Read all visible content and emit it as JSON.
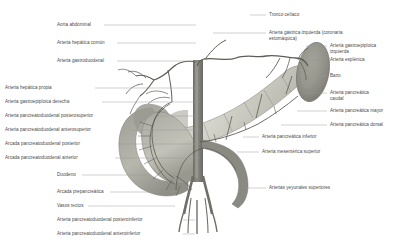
{
  "figure": {
    "language": "es",
    "background_color": "#ffffff",
    "text_color": "#4a4a4a",
    "leader_color": "#9a9a9a"
  },
  "labels_left": [
    {
      "id": "aorta-abdominal",
      "text": "Aorta abdominal",
      "x": 57,
      "y": 22,
      "line_x1": 104,
      "line_y1": 25,
      "line_x2": 196,
      "line_y2": 25
    },
    {
      "id": "arteria-hepatica-comun",
      "text": "Arteria hepática común",
      "x": 57,
      "y": 40,
      "line_x1": 117,
      "line_y1": 43,
      "line_x2": 196,
      "line_y2": 43
    },
    {
      "id": "arteria-gastroduodenal",
      "text": "Arteria gastroduodenal",
      "x": 57,
      "y": 58,
      "line_x1": 117,
      "line_y1": 61,
      "line_x2": 196,
      "line_y2": 61
    },
    {
      "id": "arteria-hepatica-propia",
      "text": "Arteria hepática propia",
      "x": 5,
      "y": 85,
      "line_x1": 95,
      "line_y1": 88,
      "line_x2": 200,
      "line_y2": 88
    },
    {
      "id": "arteria-gastroepiploica-derecha",
      "text": "Arteria gastroepiploica derecha",
      "x": 5,
      "y": 99,
      "line_x1": 102,
      "line_y1": 102,
      "line_x2": 200,
      "line_y2": 102
    },
    {
      "id": "arteria-pancreatoduodenal-posterosuperior",
      "text": "Arteria pancreatoduodenal posterosuperior",
      "x": 5,
      "y": 113,
      "line_x1": 131,
      "line_y1": 116,
      "line_x2": 200,
      "line_y2": 116
    },
    {
      "id": "arteria-pancreatoduodenal-anterosuperior",
      "text": "Arteria pancreatoduodenal anterosuperior",
      "x": 5,
      "y": 127,
      "line_x1": 131,
      "line_y1": 130,
      "line_x2": 200,
      "line_y2": 130
    },
    {
      "id": "arcada-pancreatoduodenal-posterior",
      "text": "Arcada pancreatoduodenal posterior",
      "x": 5,
      "y": 141,
      "line_x1": 118,
      "line_y1": 144,
      "line_x2": 200,
      "line_y2": 144
    },
    {
      "id": "arcada-pancreatoduodenal-anterior",
      "text": "Arcada pancreatoduodenal anterior",
      "x": 5,
      "y": 155,
      "line_x1": 115,
      "line_y1": 158,
      "line_x2": 200,
      "line_y2": 158
    },
    {
      "id": "duodeno",
      "text": "Duodeno",
      "x": 57,
      "y": 172,
      "line_x1": 82,
      "line_y1": 175,
      "line_x2": 148,
      "line_y2": 175
    },
    {
      "id": "arcada-prepancreatica",
      "text": "Arcada prepancreática",
      "x": 57,
      "y": 189,
      "line_x1": 110,
      "line_y1": 192,
      "line_x2": 175,
      "line_y2": 192
    },
    {
      "id": "vasos-rectos",
      "text": "Vasos rectos",
      "x": 57,
      "y": 203,
      "line_x1": 88,
      "line_y1": 206,
      "line_x2": 175,
      "line_y2": 206
    },
    {
      "id": "arteria-pancreatoduodenal-posteroinferior",
      "text": "Arteria pancreatoduodenal posteroinferior",
      "x": 57,
      "y": 217,
      "line_x1": 183,
      "line_y1": 220,
      "line_x2": 195,
      "line_y2": 220
    },
    {
      "id": "arteria-pancreatoduodenal-anteroinferior",
      "text": "Arteria pancreatoduodenal anteroinferior",
      "x": 57,
      "y": 231,
      "line_x1": 183,
      "line_y1": 234,
      "line_x2": 195,
      "line_y2": 234
    }
  ],
  "labels_right": [
    {
      "id": "tronco-celiaco",
      "text": "Tronco celíaco",
      "x": 269,
      "y": 12,
      "line_x1": 250,
      "line_y1": 15,
      "line_x2": 266,
      "line_y2": 15
    },
    {
      "id": "arteria-gastrica-izquierda",
      "text": "Arteria gástrica izquierda (coronaria\nestomáquica)",
      "x": 269,
      "y": 30,
      "line_x1": 213,
      "line_y1": 33,
      "line_x2": 266,
      "line_y2": 33
    },
    {
      "id": "arteria-gastroepiploica-izq",
      "text": "Arteria gastroepiploica\nizquierda",
      "x": 330,
      "y": 43,
      "line_x1": 306,
      "line_y1": 46,
      "line_x2": 327,
      "line_y2": 46
    },
    {
      "id": "arteria-esplenica",
      "text": "Arteria esplénica",
      "x": 330,
      "y": 57,
      "line_x1": 306,
      "line_y1": 60,
      "line_x2": 327,
      "line_y2": 60
    },
    {
      "id": "bazo",
      "text": "Bazo",
      "x": 330,
      "y": 73,
      "line_x1": 314,
      "line_y1": 76,
      "line_x2": 327,
      "line_y2": 76
    },
    {
      "id": "arteria-pancreatica-caudal",
      "text": "Arteria pancreática\ncaudal",
      "x": 330,
      "y": 90,
      "line_x1": 303,
      "line_y1": 93,
      "line_x2": 327,
      "line_y2": 93
    },
    {
      "id": "arteria-pancreatica-mayor",
      "text": "Arteria pancreática mayor",
      "x": 330,
      "y": 108,
      "line_x1": 297,
      "line_y1": 111,
      "line_x2": 327,
      "line_y2": 111
    },
    {
      "id": "arteria-pancreatica-dorsal",
      "text": "Arteria pancreática dorsal",
      "x": 330,
      "y": 122,
      "line_x1": 281,
      "line_y1": 125,
      "line_x2": 327,
      "line_y2": 125
    },
    {
      "id": "arteria-pancreatica-inferior",
      "text": "Arteria pancreática inferior",
      "x": 262,
      "y": 134,
      "line_x1": 243,
      "line_y1": 137,
      "line_x2": 259,
      "line_y2": 137
    },
    {
      "id": "arteria-mesenterica-superior",
      "text": "Arteria mesentérica superior",
      "x": 262,
      "y": 149,
      "line_x1": 237,
      "line_y1": 152,
      "line_x2": 259,
      "line_y2": 152
    },
    {
      "id": "arterias-yeyunales-superiores",
      "text": "Arterias yeyunales superiores",
      "x": 269,
      "y": 185,
      "line_x1": 245,
      "line_y1": 188,
      "line_x2": 266,
      "line_y2": 188
    }
  ],
  "illustration": {
    "structures": [
      {
        "name": "pancreas-body-tail",
        "color": "#c9c9c0"
      },
      {
        "name": "pancreas-head",
        "color": "#b0b0a8"
      },
      {
        "name": "duodenum",
        "color": "#a8a8a0"
      },
      {
        "name": "spleen",
        "color": "#8f8f88"
      },
      {
        "name": "aorta",
        "color": "#7e7e78"
      },
      {
        "name": "arteries",
        "color": "#6a6a64"
      },
      {
        "name": "liver-hilum",
        "color": "#9a9a92"
      }
    ]
  }
}
